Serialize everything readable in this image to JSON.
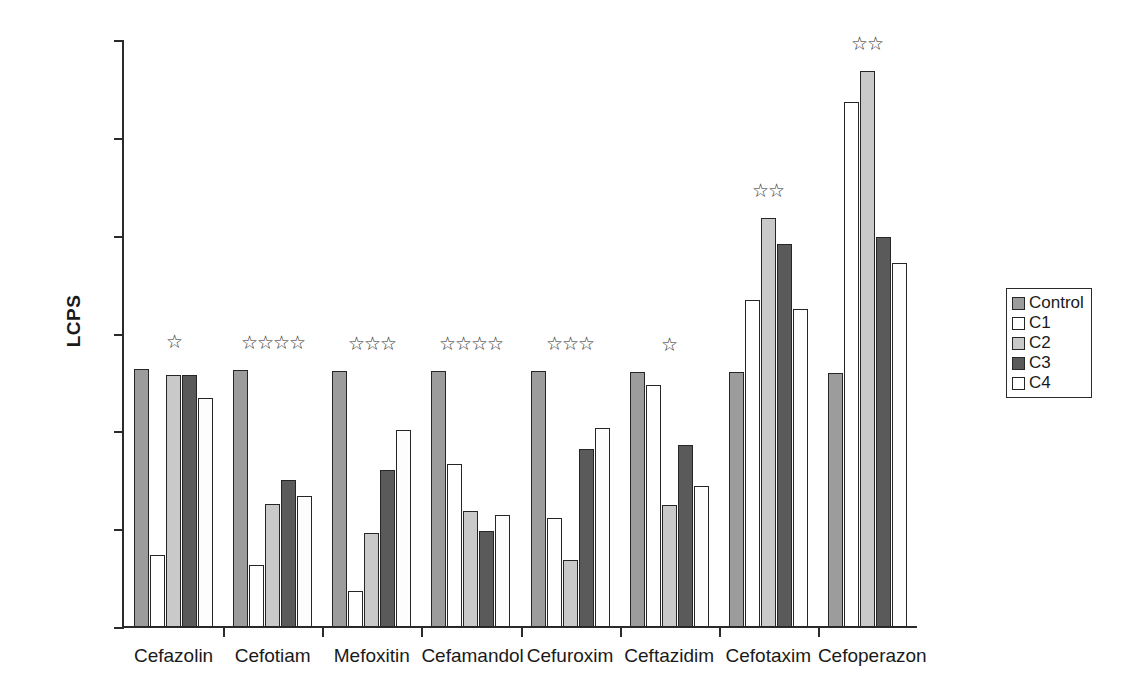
{
  "chart_data": {
    "type": "bar",
    "title": "",
    "xlabel": "",
    "ylabel": "LCPS",
    "ylim": [
      0,
      6000
    ],
    "ytick_values": [
      0,
      1000,
      2000,
      3000,
      4000,
      5000,
      6000
    ],
    "ytick_labels": [
      "0",
      "1000",
      "2000",
      "3000",
      "4000",
      "5000",
      "6000"
    ],
    "grid": false,
    "legend_position": "right",
    "categories": [
      "Cefazolin",
      "Cefotiam",
      "Mefoxitin",
      "Cefamandol",
      "Cefuroxim",
      "Ceftazidim",
      "Cefotaxim",
      "Cefoperazon"
    ],
    "series": [
      {
        "name": "Control",
        "color": "#9c9c9c",
        "values": [
          2640,
          2630,
          2620,
          2620,
          2620,
          2610,
          2610,
          2600
        ]
      },
      {
        "name": "C1",
        "color": "#ffffff",
        "values": [
          740,
          630,
          370,
          1670,
          1110,
          2470,
          3340,
          5370
        ]
      },
      {
        "name": "C2",
        "color": "#c9c9c9",
        "values": [
          2580,
          1260,
          960,
          1185,
          680,
          1250,
          4180,
          5680
        ]
      },
      {
        "name": "C3",
        "color": "#5a5a5a",
        "values": [
          2580,
          1500,
          1610,
          985,
          1820,
          1860,
          3910,
          3990
        ]
      },
      {
        "name": "C4",
        "color": "#fdfdfd",
        "values": [
          2340,
          1340,
          2010,
          1150,
          2030,
          1440,
          3250,
          3720
        ]
      }
    ],
    "annotations": {
      "marker": "☆",
      "star_counts": [
        1,
        4,
        3,
        4,
        3,
        1,
        2,
        2
      ],
      "star_label": "significance stars"
    }
  },
  "legend": {
    "items": [
      {
        "label": "Control",
        "key": "control"
      },
      {
        "label": "C1",
        "key": "c1"
      },
      {
        "label": "C2",
        "key": "c2"
      },
      {
        "label": "C3",
        "key": "c3"
      },
      {
        "label": "C4",
        "key": "c4"
      }
    ]
  }
}
